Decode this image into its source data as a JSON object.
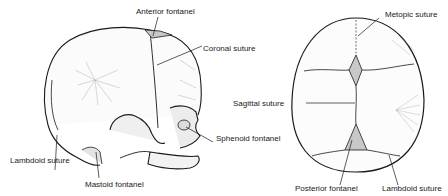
{
  "figure": {
    "lateral_view": {
      "labels": {
        "anterior_fontanel": "Anterior fontanel",
        "coronal_suture": "Coronal suture",
        "sphenoid_fontanel": "Sphenoid fontanel",
        "lambdoid_suture": "Lambdoid suture",
        "mastoid_fontanel": "Mastoid fontanel"
      }
    },
    "superior_view": {
      "labels": {
        "metopic_suture": "Metopic suture",
        "sagittal_suture": "Sagittal suture",
        "posterior_fontanel": "Posterior fontanel",
        "lambdoid_suture": "Lambdoid suture"
      }
    },
    "colors": {
      "line": "#1a1a1a",
      "fontanel_fill": "#c8c8c8",
      "shade": "#9a9a9a"
    }
  }
}
